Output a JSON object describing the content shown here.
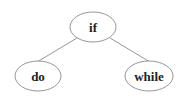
{
  "diagram": {
    "type": "tree",
    "nodes": [
      {
        "id": "if",
        "label": "if",
        "cx": 93,
        "cy": 27,
        "rx": 23,
        "ry": 15
      },
      {
        "id": "do",
        "label": "do",
        "cx": 38,
        "cy": 76,
        "rx": 23,
        "ry": 15
      },
      {
        "id": "while",
        "label": "while",
        "cx": 149,
        "cy": 76,
        "rx": 24,
        "ry": 15
      }
    ],
    "edges": [
      {
        "from": "if",
        "to": "do"
      },
      {
        "from": "if",
        "to": "while"
      }
    ],
    "colors": {
      "stroke": "#8a8a8a",
      "text": "#222222",
      "background": "#ffffff"
    }
  }
}
